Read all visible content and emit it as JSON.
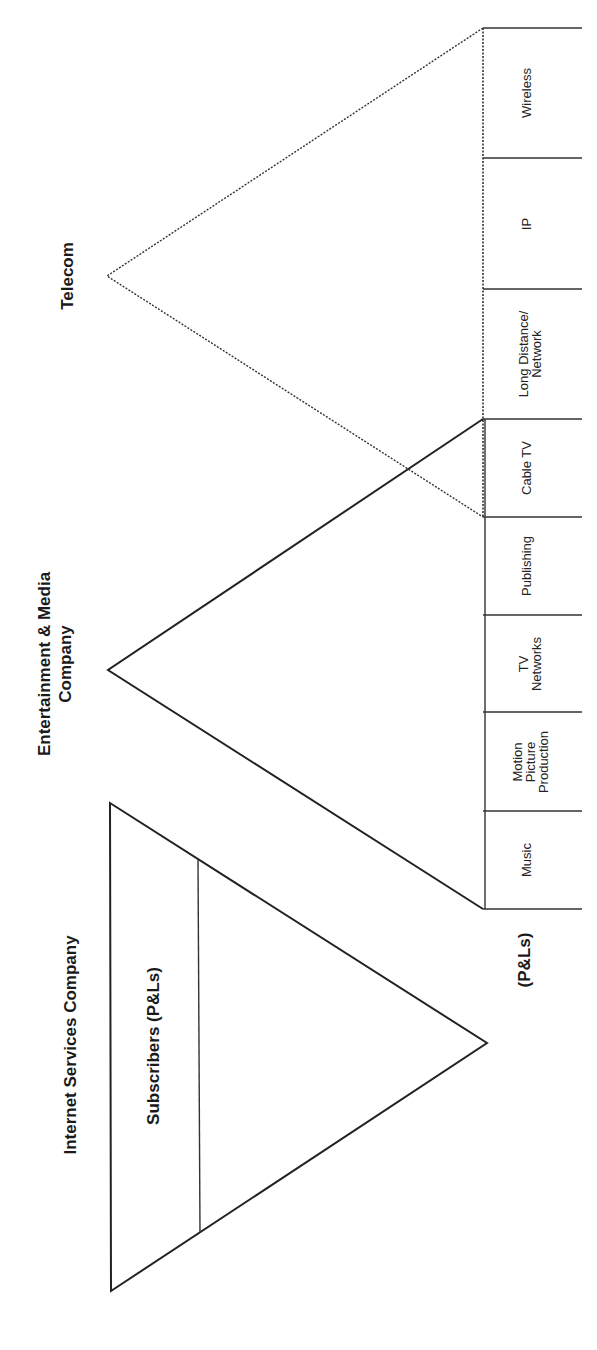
{
  "diagram": {
    "orientation": "rotated-90-ccw",
    "line_color": "#222222",
    "background": "#ffffff",
    "telecom": {
      "title": "Telecom",
      "line_style": "dotted",
      "segments": [
        {
          "lines": [
            "Wireless"
          ]
        },
        {
          "lines": [
            "IP"
          ]
        },
        {
          "lines": [
            "Long Distance/",
            "Network"
          ]
        },
        {
          "lines": [
            "Cable TV"
          ]
        }
      ]
    },
    "entertainment_media": {
      "title_lines": [
        "Entertainment & Media",
        "Company"
      ],
      "line_style": "solid",
      "segments": [
        {
          "lines": [
            "Cable TV"
          ]
        },
        {
          "lines": [
            "Publishing"
          ]
        },
        {
          "lines": [
            "TV",
            "Networks"
          ]
        },
        {
          "lines": [
            "Motion",
            "Picture",
            "Production"
          ]
        },
        {
          "lines": [
            "Music"
          ]
        }
      ],
      "footer_label": "(P&Ls)"
    },
    "internet_services": {
      "title": "Internet Services Company",
      "line_style": "solid",
      "band_label": "Subscribers (P&Ls)"
    }
  }
}
